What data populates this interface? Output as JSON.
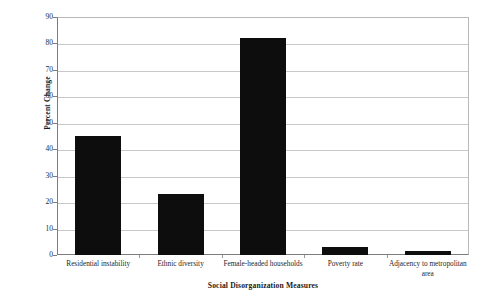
{
  "chart_data": {
    "type": "bar",
    "title": "",
    "xlabel": "Social Disorganization Measures",
    "ylabel": "Percent Change",
    "categories": [
      "Residential instability",
      "Ethnic diversity",
      "Female-headed households",
      "Poverty rate",
      "Adjacency to metropolitan area"
    ],
    "values": [
      45,
      23,
      82,
      3,
      1.5
    ],
    "ylim": [
      0,
      90
    ],
    "ytick_labels": [
      "90",
      "80",
      "70",
      "60",
      "50",
      "40",
      "30",
      "20",
      "10",
      "0"
    ],
    "ytick_values": [
      90,
      80,
      70,
      60,
      50,
      40,
      30,
      20,
      10,
      0
    ],
    "grid": true,
    "legend": "none",
    "bar_color": "#0d0d0d",
    "grid_color": "#c8c8c8",
    "axis_color": "#7d7d7d",
    "background": "#ffffff"
  }
}
